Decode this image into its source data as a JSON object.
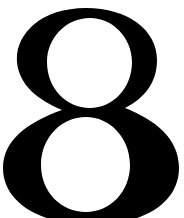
{
  "glyph": {
    "character": "8",
    "color": "#000000",
    "background": "#ffffff"
  }
}
